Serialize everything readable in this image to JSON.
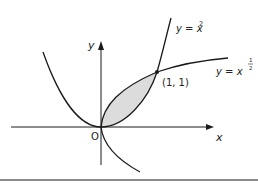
{
  "diagram": {
    "axes": {
      "x_label": "x",
      "y_label": "y",
      "origin_label": "O"
    },
    "curves": [
      {
        "name": "parabola",
        "label_lhs": "y = x",
        "label_exp": "2"
      },
      {
        "name": "root",
        "label_lhs": "y = x",
        "label_exp_num": "1",
        "label_exp_den": "2"
      }
    ],
    "intersection": {
      "label": "(1, 1)"
    },
    "colors": {
      "curve": "#1a1a1a",
      "shade": "#dcdcdc",
      "rule": "#8a8a8a"
    }
  }
}
